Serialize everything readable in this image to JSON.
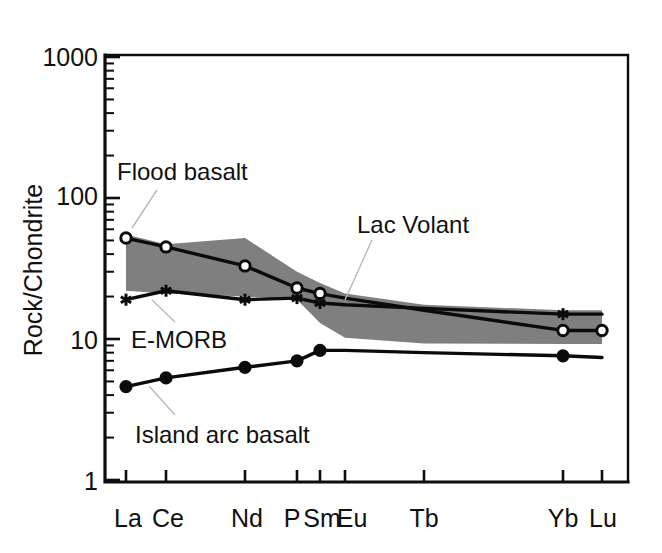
{
  "figure": {
    "background_color": "#ffffff",
    "ink_color": "#0b0b0b",
    "band_color": "#7f7f7f"
  },
  "axes": {
    "y_title": "Rock/Chondrite",
    "y_tick_labels": [
      "1000",
      "100",
      "10",
      "1"
    ],
    "y_tick_values": [
      1000,
      100,
      10,
      1
    ],
    "x_tick_labels": [
      "La",
      "Ce",
      "Nd",
      "P",
      "Sm",
      "Eu",
      "Tb",
      "Yb",
      "Lu"
    ]
  },
  "annotations": [
    {
      "name": "flood-basalt",
      "text": "Flood basalt"
    },
    {
      "name": "lac-volant",
      "text": "Lac Volant"
    },
    {
      "name": "e-morb",
      "text": "E-MORB"
    },
    {
      "name": "island-arc-basalt",
      "text": "Island arc basalt"
    }
  ],
  "chart_data": {
    "type": "line",
    "title": "",
    "subtitle": "",
    "xlabel": "",
    "ylabel": "Rock/Chondrite",
    "yscale": "log",
    "ylim": [
      1,
      1000
    ],
    "grid": false,
    "legend_position": "inline-annotations",
    "categories": [
      "La",
      "Ce",
      "Nd",
      "P",
      "Sm",
      "Eu",
      "Tb",
      "Yb",
      "Lu"
    ],
    "series": [
      {
        "name": "Flood basalt",
        "marker": "open-circle",
        "values": [
          52,
          45,
          33,
          23,
          21,
          19.5,
          16,
          11.5,
          11.5
        ]
      },
      {
        "name": "E-MORB",
        "marker": "asterisk",
        "values": [
          19,
          22,
          19,
          19.5,
          18,
          17.5,
          16.5,
          15,
          15
        ]
      },
      {
        "name": "Island arc basalt",
        "marker": "filled-circle",
        "values": [
          4.6,
          5.3,
          6.3,
          7.0,
          8.3,
          8.3,
          8.0,
          7.6,
          7.4
        ]
      }
    ],
    "bands": [
      {
        "name": "Lac Volant",
        "fill": "#7f7f7f",
        "upper": [
          55,
          47,
          52,
          30,
          25,
          21,
          17.5,
          16,
          16
        ],
        "lower": [
          22,
          21,
          20,
          19,
          13,
          10.2,
          9.3,
          9.2,
          9.2
        ]
      }
    ]
  }
}
